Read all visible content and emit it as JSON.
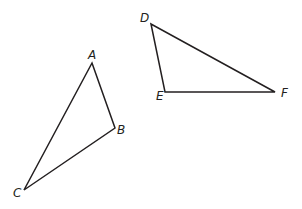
{
  "diagram": {
    "stroke_color": "#231f20",
    "triangles": [
      {
        "name": "ABC",
        "vertices": [
          {
            "label": "A",
            "x": 92,
            "y": 63
          },
          {
            "label": "B",
            "x": 115,
            "y": 128
          },
          {
            "label": "C",
            "x": 24,
            "y": 190
          }
        ]
      },
      {
        "name": "DEF",
        "vertices": [
          {
            "label": "D",
            "x": 151,
            "y": 24
          },
          {
            "label": "E",
            "x": 165,
            "y": 92
          },
          {
            "label": "F",
            "x": 275,
            "y": 92
          }
        ]
      }
    ],
    "labels": {
      "A": "A",
      "B": "B",
      "C": "C",
      "D": "D",
      "E": "E",
      "F": "F"
    }
  }
}
